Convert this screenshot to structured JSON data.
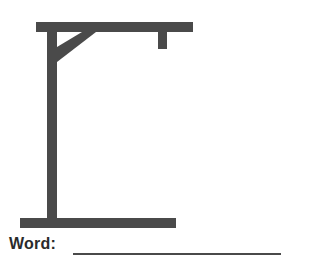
{
  "page": {
    "background_color": "#ffffff",
    "width": 309,
    "height": 264
  },
  "drawing": {
    "name": "hangman-gallows",
    "stroke_color": "#4a4a4a",
    "description": "Hangman gallows: horizontal base, vertical upright post, top cross beam, diagonal corner brace, and short rope stub hanging from the beam",
    "parts": [
      {
        "name": "base-bar",
        "shape": "rect",
        "x": 20,
        "y": 218,
        "width": 156,
        "height": 10
      },
      {
        "name": "upright-post",
        "shape": "rect",
        "x": 47,
        "y": 22,
        "width": 10,
        "height": 198
      },
      {
        "name": "top-beam",
        "shape": "rect",
        "x": 36,
        "y": 22,
        "width": 157,
        "height": 10
      },
      {
        "name": "corner-brace",
        "shape": "polygon",
        "points": "57,62 57,47 82,32 96,32"
      },
      {
        "name": "rope-stub",
        "shape": "rect",
        "x": 158,
        "y": 32,
        "width": 9,
        "height": 17
      }
    ]
  },
  "word_entry": {
    "label": "Word:",
    "blank_line": {
      "name": "word-answer-blank",
      "value": "",
      "placeholder": "",
      "color": "#4a4a4a",
      "x": 73,
      "y": 253,
      "width": 208,
      "height": 2
    }
  }
}
